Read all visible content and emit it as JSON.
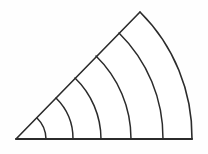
{
  "figure": {
    "background_color": "#fefefe",
    "stroke_color": "#2b2b2b",
    "fill_color": "#ffffff",
    "stroke_width": 1.5,
    "baseline_stroke_width": 2,
    "apex": {
      "x": 16,
      "y": 139
    },
    "baseline_end": {
      "x": 192,
      "y": 139
    },
    "upper_ray_end": {
      "x": 140,
      "y": 12
    },
    "sector_angle_degrees": 45.7,
    "outer_radius": 176,
    "arc_count": 6,
    "band_count": 6,
    "arcs": [
      {
        "name": "arc-1-innermost",
        "radius": 30,
        "baseline_foot_x": 46,
        "ray_end_x": 37,
        "ray_end_y": 118
      },
      {
        "name": "arc-2",
        "radius": 57,
        "baseline_foot_x": 73,
        "ray_end_x": 56,
        "ray_end_y": 98
      },
      {
        "name": "arc-3",
        "radius": 85,
        "baseline_foot_x": 101,
        "ray_end_x": 75,
        "ray_end_y": 78
      },
      {
        "name": "arc-4",
        "radius": 115,
        "baseline_foot_x": 131,
        "ray_end_x": 96,
        "ray_end_y": 56
      },
      {
        "name": "arc-5",
        "radius": 147,
        "baseline_foot_x": 163,
        "ray_end_x": 119,
        "ray_end_y": 33
      },
      {
        "name": "arc-6-outermost",
        "radius": 176,
        "baseline_foot_x": 192,
        "ray_end_x": 140,
        "ray_end_y": 12
      }
    ]
  }
}
